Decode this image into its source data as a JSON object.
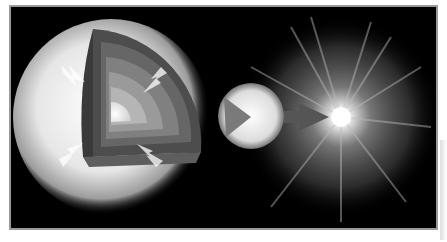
{
  "illustration": {
    "subject": "stellar core collapse to supernova",
    "panels": [
      {
        "name": "star-cutaway",
        "description": "Large star with layered cutaway and inward-pointing arrows"
      },
      {
        "name": "collapsed-core",
        "description": "Small sphere with wedge cut"
      },
      {
        "name": "supernova-explosion",
        "description": "Bright burst with radiating rays"
      }
    ],
    "colors": {
      "background": "#000000",
      "border": "#9a9a9a",
      "arrow": "#555555",
      "glow": "#ffffff"
    }
  }
}
